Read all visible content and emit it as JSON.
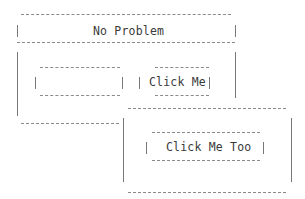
{
  "top_panel": {
    "title": "No Problem",
    "input": {
      "value": "",
      "placeholder": ""
    },
    "button_label": "Click Me"
  },
  "bottom_panel": {
    "button_label": "Click Me Too"
  },
  "style": {
    "border_color": "#8a8a8a",
    "text_color": "#3a3a3a",
    "background": "#ffffff"
  }
}
